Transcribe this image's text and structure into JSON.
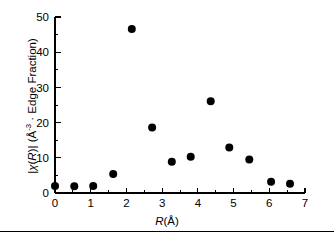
{
  "chart_data": {
    "type": "scatter",
    "title": "",
    "xlabel": "R(Å)",
    "ylabel": "|χ(R)| (Å-3 · Edge Fraction)",
    "xlabel_parts": {
      "symbol": "R",
      "unit": "(Å)"
    },
    "ylabel_parts": {
      "magnitude_open": "|",
      "symbol": "χ",
      "arg_open": "(",
      "arg": "R",
      "arg_close": ")",
      "magnitude_close": "|",
      "units_open": " (Å",
      "units_exponent": "-3",
      "units_mid": " · Edge Fraction)"
    },
    "xlim": [
      0,
      7
    ],
    "ylim": [
      0,
      50
    ],
    "xticks": [
      0,
      1,
      2,
      3,
      4,
      5,
      6,
      7
    ],
    "xticklabels": [
      "0",
      "1",
      "2",
      "3",
      "4",
      "5",
      "6",
      "7"
    ],
    "yticks": [
      0,
      10,
      20,
      30,
      40,
      50
    ],
    "yticklabels": [
      "0",
      "10",
      "20",
      "30",
      "40",
      "50"
    ],
    "x_minor_interval": 0.5,
    "y_minor_interval": 5,
    "grid": false,
    "legend": false,
    "marker": {
      "shape": "circle",
      "color": "#000000",
      "size": 5.6
    },
    "points": [
      {
        "x": 0.0,
        "y": 2.0
      },
      {
        "x": 0.54,
        "y": 1.9
      },
      {
        "x": 1.07,
        "y": 2.0
      },
      {
        "x": 1.63,
        "y": 5.4
      },
      {
        "x": 2.15,
        "y": 46.6
      },
      {
        "x": 2.72,
        "y": 18.6
      },
      {
        "x": 3.27,
        "y": 8.9
      },
      {
        "x": 3.8,
        "y": 10.3
      },
      {
        "x": 4.36,
        "y": 26.1
      },
      {
        "x": 4.88,
        "y": 12.9
      },
      {
        "x": 5.44,
        "y": 9.5
      },
      {
        "x": 6.05,
        "y": 3.2
      },
      {
        "x": 6.58,
        "y": 2.6
      }
    ]
  },
  "axes_geometry": {
    "x0_px": 55,
    "x1_px": 305,
    "y0_px": 193,
    "y1_px": 17
  }
}
